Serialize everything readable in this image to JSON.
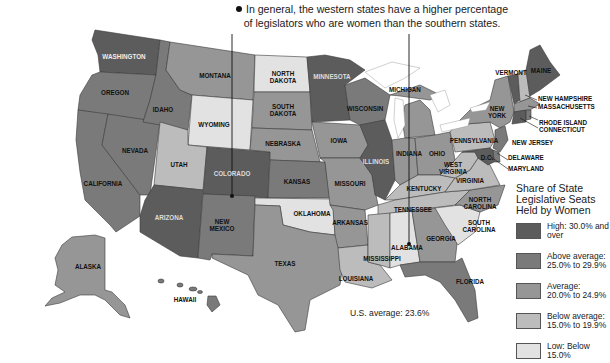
{
  "callout": {
    "text_line1": "In general, the western states have a higher percentage",
    "text_line2": "of legislators who are women than the southern states."
  },
  "legend": {
    "title_line1": "Share of State",
    "title_line2": "Legislative Seats",
    "title_line3": "Held by Women",
    "items": [
      {
        "key": "high",
        "label_line1": "High: 30.0% and",
        "label_line2": "over",
        "color": "#5c5c5c"
      },
      {
        "key": "above",
        "label_line1": "Above average:",
        "label_line2": "25.0% to 29.9%",
        "color": "#7a7a7a"
      },
      {
        "key": "average",
        "label_line1": "Average:",
        "label_line2": "20.0% to 24.9%",
        "color": "#969696"
      },
      {
        "key": "below",
        "label_line1": "Below average:",
        "label_line2": "15.0% to 19.9%",
        "color": "#bcbcbc"
      },
      {
        "key": "low",
        "label_line1": "Low: Below",
        "label_line2": "15.0%",
        "color": "#e2e2e2"
      }
    ]
  },
  "us_average": "U.S. average: 23.6%",
  "states": {
    "washington": {
      "label": "WASHINGTON",
      "category": "high"
    },
    "oregon": {
      "label": "OREGON",
      "category": "above"
    },
    "california": {
      "label": "CALIFORNIA",
      "category": "above"
    },
    "nevada": {
      "label": "NEVADA",
      "category": "above"
    },
    "idaho": {
      "label": "IDAHO",
      "category": "above"
    },
    "montana": {
      "label": "MONTANA",
      "category": "average"
    },
    "wyoming": {
      "label": "WYOMING",
      "category": "low"
    },
    "utah": {
      "label": "UTAH",
      "category": "below"
    },
    "colorado": {
      "label": "COLORADO",
      "category": "high"
    },
    "arizona": {
      "label": "ARIZONA",
      "category": "high"
    },
    "new_mexico": {
      "label_line1": "NEW",
      "label_line2": "MEXICO",
      "category": "above"
    },
    "north_dakota": {
      "label_line1": "NORTH",
      "label_line2": "DAKOTA",
      "category": "low"
    },
    "south_dakota": {
      "label_line1": "SOUTH",
      "label_line2": "DAKOTA",
      "category": "average"
    },
    "nebraska": {
      "label": "NEBRASKA",
      "category": "average"
    },
    "kansas": {
      "label": "KANSAS",
      "category": "above"
    },
    "oklahoma": {
      "label": "OKLAHOMA",
      "category": "low"
    },
    "texas": {
      "label": "TEXAS",
      "category": "average"
    },
    "minnesota": {
      "label": "MINNESOTA",
      "category": "high"
    },
    "iowa": {
      "label": "IOWA",
      "category": "average"
    },
    "missouri": {
      "label": "MISSOURI",
      "category": "average"
    },
    "arkansas": {
      "label": "ARKANSAS",
      "category": "average"
    },
    "louisiana": {
      "label": "LOUISIANA",
      "category": "below"
    },
    "wisconsin": {
      "label": "WISCONSIN",
      "category": "above"
    },
    "illinois": {
      "label": "ILLINOIS",
      "category": "high"
    },
    "michigan": {
      "label": "MICHIGAN",
      "category": "average"
    },
    "indiana": {
      "label": "INDIANA",
      "category": "average"
    },
    "ohio": {
      "label": "OHIO",
      "category": "average"
    },
    "kentucky": {
      "label": "KENTUCKY",
      "category": "below"
    },
    "tennessee": {
      "label": "TENNESSEE",
      "category": "below"
    },
    "mississippi": {
      "label": "MISSISSIPPI",
      "category": "below"
    },
    "alabama": {
      "label": "ALABAMA",
      "category": "low"
    },
    "georgia": {
      "label": "GEORGIA",
      "category": "average"
    },
    "florida": {
      "label": "FLORIDA",
      "category": "above"
    },
    "south_carolina": {
      "label_line1": "SOUTH",
      "label_line2": "CAROLINA",
      "category": "low"
    },
    "north_carolina": {
      "label_line1": "NORTH",
      "label_line2": "CAROLINA",
      "category": "average"
    },
    "virginia": {
      "label": "VIRGINIA",
      "category": "below"
    },
    "west_virginia": {
      "label_line1": "WEST",
      "label_line2": "VIRGINIA",
      "category": "below"
    },
    "pennsylvania": {
      "label": "PENNSYLVANIA",
      "category": "below"
    },
    "new_york": {
      "label_line1": "NEW",
      "label_line2": "YORK",
      "category": "average"
    },
    "vermont": {
      "label": "VERMONT",
      "category": "high"
    },
    "maine": {
      "label": "MAINE",
      "category": "high"
    },
    "new_hampshire": {
      "label": "NEW HAMPSHIRE",
      "category": "below"
    },
    "massachusetts": {
      "label": "MASSACHUSETTS",
      "category": "average"
    },
    "rhode_island": {
      "label": "RHODE ISLAND",
      "category": "above"
    },
    "connecticut": {
      "label": "CONNECTICUT",
      "category": "high"
    },
    "new_jersey": {
      "label": "NEW JERSEY",
      "category": "above"
    },
    "delaware": {
      "label": "DELAWARE",
      "category": "above"
    },
    "maryland": {
      "label": "MARYLAND",
      "category": "high"
    },
    "dc": {
      "label": "D.C.",
      "category": "high"
    },
    "alaska": {
      "label": "ALASKA",
      "category": "average"
    },
    "hawaii": {
      "label": "HAWAII",
      "category": "above"
    }
  }
}
